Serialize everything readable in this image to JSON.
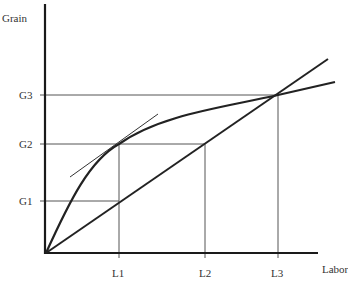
{
  "diagram": {
    "y_axis_label": "Grain",
    "x_axis_label": "Labor",
    "y_ticks": [
      {
        "label": "G3",
        "y": 95
      },
      {
        "label": "G2",
        "y": 144
      },
      {
        "label": "G1",
        "y": 201
      }
    ],
    "x_ticks": [
      {
        "label": "L1",
        "x": 119
      },
      {
        "label": "L2",
        "x": 205
      },
      {
        "label": "L3",
        "x": 278
      }
    ],
    "curves": [
      {
        "name": "production-function-curve",
        "type": "concave"
      },
      {
        "name": "straight-line-from-origin",
        "type": "linear"
      },
      {
        "name": "tangent-line-at-L1",
        "type": "linear"
      }
    ],
    "colors": {
      "axis": "#1a1a1a",
      "curve": "#222222",
      "guide": "#444444",
      "text": "#333333"
    }
  }
}
